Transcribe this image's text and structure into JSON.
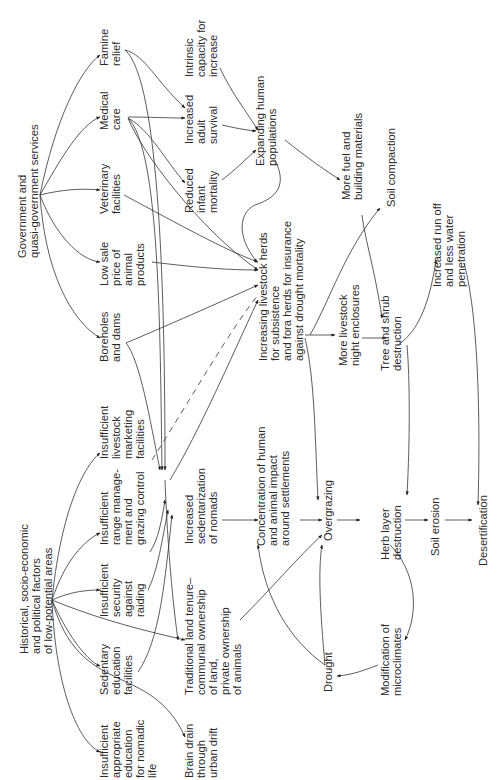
{
  "diagram": {
    "orientation": "rotated-90-ccw",
    "nodes": [
      {
        "id": "gov",
        "lines": [
          "Government and",
          "quasi-government services"
        ]
      },
      {
        "id": "famine",
        "lines": [
          "Famine",
          "relief"
        ]
      },
      {
        "id": "medical",
        "lines": [
          "Medical",
          "care"
        ]
      },
      {
        "id": "vet",
        "lines": [
          "Veterinary",
          "facilities"
        ]
      },
      {
        "id": "lowsale",
        "lines": [
          "Low sale",
          "price of",
          "animal",
          "products"
        ]
      },
      {
        "id": "boreholes",
        "lines": [
          "Boreholes",
          "and dams"
        ]
      },
      {
        "id": "intrinsic",
        "lines": [
          "Intrinsic",
          "capacity for",
          "increase"
        ]
      },
      {
        "id": "adult",
        "lines": [
          "Increased",
          "adult",
          "survival"
        ]
      },
      {
        "id": "infant",
        "lines": [
          "Reduced",
          "infant",
          "mortality"
        ]
      },
      {
        "id": "expanding",
        "lines": [
          "Expanding human",
          "populations"
        ]
      },
      {
        "id": "fuel",
        "lines": [
          "More fuel and",
          "building materials"
        ]
      },
      {
        "id": "soilcomp",
        "lines": [
          "Soil compaction"
        ]
      },
      {
        "id": "herds",
        "lines": [
          "Increasing livestock herds",
          "for subsistence",
          "and fora herds for insurance",
          "against drought mortality"
        ]
      },
      {
        "id": "enclosures",
        "lines": [
          "More livestock",
          "night enclosures"
        ]
      },
      {
        "id": "tree",
        "lines": [
          "Tree and shrub",
          "destruction"
        ]
      },
      {
        "id": "runoff",
        "lines": [
          "Increased run off",
          "and less water",
          "penetration"
        ]
      },
      {
        "id": "hist",
        "lines": [
          "Historical, socio-economic",
          "and political factors",
          "of low-potential areas"
        ]
      },
      {
        "id": "marketing",
        "lines": [
          "Insufficient",
          "livestock",
          "marketing",
          "facilities"
        ]
      },
      {
        "id": "range",
        "lines": [
          "Insufficient",
          "range manage-",
          "ment and",
          "grazing control"
        ]
      },
      {
        "id": "security",
        "lines": [
          "Insufficient",
          "security",
          "against",
          "raiding"
        ]
      },
      {
        "id": "sedentary",
        "lines": [
          "Sedentary",
          "education",
          "facilities"
        ]
      },
      {
        "id": "appropriate",
        "lines": [
          "Insufficient",
          "appropriate",
          "education",
          "for nomadic",
          "life"
        ]
      },
      {
        "id": "sedentarization",
        "lines": [
          "Increased",
          "sedentarization",
          "of nomads"
        ]
      },
      {
        "id": "concentration",
        "lines": [
          "Concentration of human",
          "and animal impact",
          "around settlements"
        ]
      },
      {
        "id": "overgrazing",
        "lines": [
          "Overgrazing"
        ]
      },
      {
        "id": "tenure",
        "lines": [
          "Traditional land tenure–",
          "communal ownership",
          "of land,",
          "private ownership",
          "of animals"
        ]
      },
      {
        "id": "brain",
        "lines": [
          "Brain drain",
          "through",
          "urban drift"
        ]
      },
      {
        "id": "drought",
        "lines": [
          "Drought"
        ]
      },
      {
        "id": "herb",
        "lines": [
          "Herb layer",
          "destruction"
        ]
      },
      {
        "id": "erosion",
        "lines": [
          "Soil erosion"
        ]
      },
      {
        "id": "desertification",
        "lines": [
          "Desertification"
        ]
      },
      {
        "id": "microclimates",
        "lines": [
          "Modification of",
          "microclimates"
        ]
      }
    ]
  }
}
